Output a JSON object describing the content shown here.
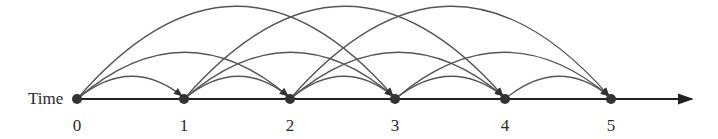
{
  "diagram": {
    "axis_label": "Time",
    "nodes": [
      {
        "label": "0",
        "x": 77
      },
      {
        "label": "1",
        "x": 184
      },
      {
        "label": "2",
        "x": 290
      },
      {
        "label": "3",
        "x": 395
      },
      {
        "label": "4",
        "x": 505
      },
      {
        "label": "5",
        "x": 611
      }
    ],
    "axis_y": 99,
    "axis_end_x": 692,
    "label_y": 131,
    "arc_spans": [
      1,
      2,
      3
    ],
    "arc_peaks": {
      "1": 77,
      "2": 53,
      "3": 7
    },
    "colors": {
      "arc": "#555555",
      "axis": "#222222",
      "node": "#333333",
      "text": "#2a2a2a"
    }
  }
}
